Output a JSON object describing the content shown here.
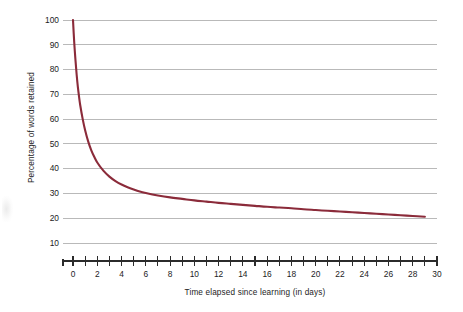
{
  "chart_data": {
    "type": "line",
    "title": "",
    "subtitle": "",
    "xlabel": "Time elapsed since learning (in days)",
    "ylabel": "Percentage of words retained",
    "xlim": [
      0,
      30
    ],
    "ylim": [
      0,
      100
    ],
    "grid": "horizontal",
    "legend": "none",
    "line_color": "#8b2b3a",
    "grid_color": "#b9b9b9",
    "axis_color": "#2b2b2b",
    "y_ticks": [
      10,
      20,
      30,
      40,
      50,
      60,
      70,
      80,
      90,
      100
    ],
    "y_tick_labels": [
      "10",
      "20",
      "30",
      "40",
      "50",
      "60",
      "70",
      "80",
      "90",
      "100"
    ],
    "x_ticks": [
      0,
      1,
      2,
      3,
      4,
      5,
      6,
      7,
      8,
      9,
      10,
      11,
      12,
      13,
      14,
      15,
      16,
      17,
      18,
      19,
      20,
      21,
      22,
      23,
      24,
      25,
      26,
      27,
      28,
      29,
      30
    ],
    "x_tick_labels": [
      "0",
      "",
      "2",
      "",
      "4",
      "",
      "6",
      "",
      "8",
      "",
      "10",
      "",
      "12",
      "",
      "14",
      "",
      "16",
      "",
      "18",
      "",
      "20",
      "",
      "22",
      "",
      "24",
      "",
      "26",
      "",
      "28",
      "",
      "30"
    ],
    "x_labeled_ticks": [
      0,
      2,
      4,
      6,
      8,
      10,
      12,
      14,
      16,
      18,
      20,
      22,
      24,
      26,
      28,
      30
    ],
    "series": [
      {
        "name": "Percentage of words retained",
        "x": [
          0,
          0.1,
          0.2,
          0.3,
          0.4,
          0.5,
          0.6,
          0.8,
          1,
          1.25,
          1.5,
          1.75,
          2,
          2.5,
          3,
          3.5,
          4,
          4.5,
          5,
          5.5,
          6,
          7,
          8,
          9,
          10,
          11,
          12,
          13,
          14,
          15,
          16,
          17,
          18,
          19,
          20,
          21,
          22,
          23,
          24,
          25,
          26,
          27,
          28,
          29
        ],
        "values": [
          100,
          91,
          84,
          78,
          73,
          69,
          65.5,
          60,
          55.5,
          51,
          47.5,
          44.8,
          42.5,
          39.2,
          36.8,
          35,
          33.6,
          32.5,
          31.6,
          30.8,
          30.2,
          29.2,
          28.4,
          27.8,
          27.2,
          26.7,
          26.2,
          25.8,
          25.4,
          25,
          24.6,
          24.3,
          24,
          23.6,
          23.3,
          23,
          22.7,
          22.4,
          22.1,
          21.8,
          21.5,
          21.2,
          20.9,
          20.6
        ]
      }
    ],
    "annotations": []
  }
}
